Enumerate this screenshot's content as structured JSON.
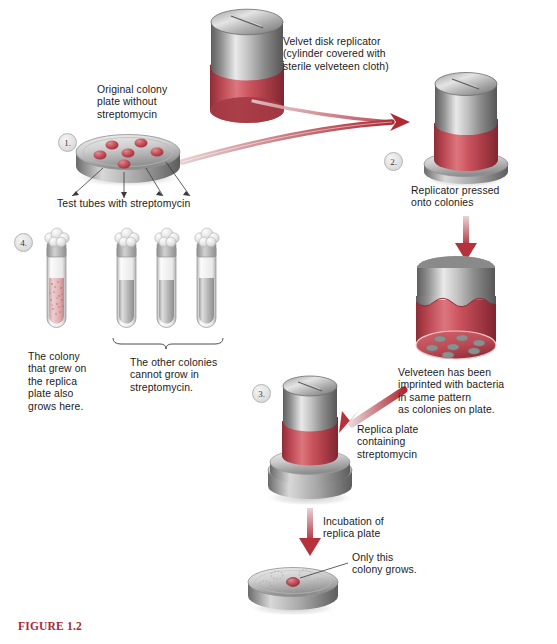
{
  "figure": {
    "caption": "FIGURE 1.2",
    "caption_color": "#a82a38"
  },
  "palette": {
    "velveteen_red": "#c9525c",
    "velveteen_red_dark": "#9e333d",
    "arrow_red": "#b5323c",
    "metal_light": "#e6e6e6",
    "metal_dark": "#6d6d6d",
    "colony_red": "#c0424c",
    "text": "#1b1b1b"
  },
  "steps": [
    {
      "id": "1",
      "number": "1."
    },
    {
      "id": "2",
      "number": "2."
    },
    {
      "id": "3",
      "number": "3."
    },
    {
      "id": "4",
      "number": "4."
    }
  ],
  "labels": {
    "velvet_replicator": "Velvet disk replicator\n(cylinder covered with\nsterile velveteen cloth)",
    "original_plate": "Original colony\nplate without\nstreptomycin",
    "test_tubes": "Test tubes with streptomycin",
    "replicator_pressed": "Replicator pressed\nonto colonies",
    "velveteen_imprinted": "Velveteen has been\nimprinted with bacteria\nin same pattern\nas colonies on plate.",
    "replica_plate": "Replica plate\ncontaining\nstreptomycin",
    "incubation": "Incubation of\nreplica plate",
    "only_colony": "Only this\ncolony grows.",
    "colony_grew": "The colony\nthat grew on\nthe replica\nplate also\ngrows here.",
    "other_colonies": "The other colonies\ncannot grow in\nstreptomycin."
  },
  "objects": {
    "original_plate_colonies": 6,
    "imprint_dots": 7,
    "final_plate_ghost_colonies": 6,
    "final_plate_grown_colonies": 1,
    "test_tubes_total": 4,
    "test_tube_resistant": 1,
    "test_tubes_clear": 3
  }
}
